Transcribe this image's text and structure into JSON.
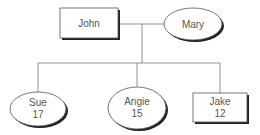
{
  "diagram": {
    "type": "family-tree",
    "colors": {
      "line": "#777777",
      "shape_stroke": "#333333",
      "shadow": "#222222",
      "fill": "#ffffff",
      "text": "#555555"
    },
    "parents": [
      {
        "id": "john",
        "name": "John",
        "shape": "rectangle"
      },
      {
        "id": "mary",
        "name": "Mary",
        "shape": "ellipse"
      }
    ],
    "children": [
      {
        "id": "sue",
        "name": "Sue",
        "age": "17",
        "shape": "ellipse"
      },
      {
        "id": "angie",
        "name": "Angie",
        "age": "15",
        "shape": "ellipse"
      },
      {
        "id": "jake",
        "name": "Jake",
        "age": "12",
        "shape": "rectangle"
      }
    ]
  }
}
